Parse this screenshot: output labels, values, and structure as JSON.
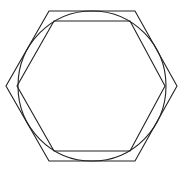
{
  "diagram": {
    "width": 185,
    "height": 172,
    "background": "#ffffff",
    "stroke": "#222222",
    "stroke_width": 1.1,
    "outer_hexagon": {
      "points": "49,11 135,11 177,86 135,161 49,161 6,86"
    },
    "circle": {
      "cx": 92,
      "cy": 86,
      "rx": 74,
      "ry": 75
    },
    "inner_hexagon": {
      "points": "54,21 130,21 165,86 130,151 54,151 17,86"
    }
  }
}
